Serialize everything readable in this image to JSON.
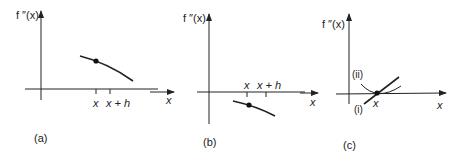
{
  "figure": {
    "panels": [
      {
        "id": "a",
        "caption": "(a)",
        "y_axis_label": "f ″(x)",
        "x_axis_label": "x",
        "tick_labels": [
          "x",
          "x + h"
        ],
        "description": "Positive decreasing second derivative; point marked at x"
      },
      {
        "id": "b",
        "caption": "(b)",
        "y_axis_label": "f ″(x)",
        "x_axis_label": "",
        "tick_labels": [
          "x",
          "x + h"
        ],
        "description": "Negative decreasing second derivative; point marked at x"
      },
      {
        "id": "c",
        "caption": "(c)",
        "y_axis_label": "f ″(x)",
        "x_axis_label": "x",
        "tick_labels": [
          "x"
        ],
        "curve_labels": [
          "(i)",
          "(ii)"
        ],
        "description": "Second derivative zero at x: (i) crosses zero, (ii) touches zero"
      }
    ],
    "between_label_ab": "x"
  }
}
